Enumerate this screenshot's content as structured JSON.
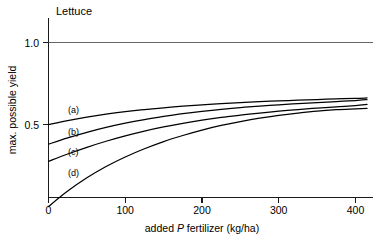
{
  "chart_data": {
    "type": "line",
    "title": "Lettuce",
    "xlabel": "added P fertilizer (kg/ha)",
    "xlabel_parts": {
      "pre": "added ",
      "italic": "P",
      "post": " fertilizer (kg/ha)"
    },
    "ylabel": "max. possible yield",
    "xlim": [
      0,
      420
    ],
    "ylim": [
      0.0,
      1.08
    ],
    "xticks": [
      0,
      100,
      200,
      300,
      400
    ],
    "xtick_labels": [
      "0",
      "100",
      "200",
      "300",
      "400"
    ],
    "yticks": [
      0.5,
      1.0
    ],
    "ytick_labels": [
      "0.5",
      "1.0"
    ],
    "grid": false,
    "legend": "inline-curve-labels",
    "reference_line": {
      "label": "1.0",
      "y": 1.0,
      "color": "#555555"
    },
    "line_color": "#000000",
    "background": "#ffffff",
    "x": [
      0,
      25,
      50,
      75,
      100,
      125,
      150,
      175,
      200,
      225,
      250,
      275,
      300,
      325,
      350,
      375,
      400,
      415
    ],
    "series": [
      {
        "name": "(a)",
        "label": "(a)",
        "label_x": 40,
        "label_y": 0.585,
        "y0": 0.5,
        "yend": 0.662,
        "values": [
          0.5,
          0.524,
          0.545,
          0.563,
          0.578,
          0.591,
          0.602,
          0.612,
          0.62,
          0.627,
          0.633,
          0.639,
          0.644,
          0.648,
          0.652,
          0.656,
          0.659,
          0.662
        ]
      },
      {
        "name": "(b)",
        "label": "(b)",
        "label_x": 40,
        "label_y": 0.452,
        "y0": 0.38,
        "yend": 0.652,
        "values": [
          0.38,
          0.418,
          0.452,
          0.482,
          0.508,
          0.53,
          0.549,
          0.566,
          0.58,
          0.592,
          0.603,
          0.612,
          0.62,
          0.628,
          0.634,
          0.64,
          0.646,
          0.652
        ]
      },
      {
        "name": "(c)",
        "label": "(c)",
        "label_x": 40,
        "label_y": 0.328,
        "y0": 0.275,
        "yend": 0.622,
        "values": [
          0.275,
          0.32,
          0.361,
          0.398,
          0.431,
          0.46,
          0.485,
          0.507,
          0.526,
          0.543,
          0.557,
          0.57,
          0.581,
          0.591,
          0.6,
          0.608,
          0.615,
          0.622
        ]
      },
      {
        "name": "(d)",
        "label": "(d)",
        "label_x": 40,
        "label_y": 0.2,
        "y0": 0.0,
        "yend": 0.598,
        "values": [
          0.0,
          0.094,
          0.175,
          0.244,
          0.302,
          0.352,
          0.396,
          0.433,
          0.466,
          0.494,
          0.518,
          0.539,
          0.556,
          0.57,
          0.582,
          0.59,
          0.595,
          0.598
        ]
      }
    ]
  }
}
